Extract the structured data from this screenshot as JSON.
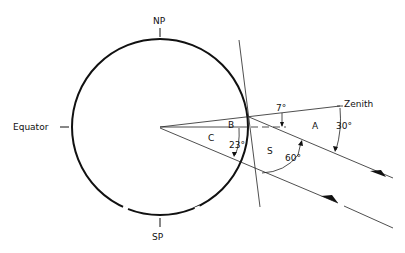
{
  "diagram": {
    "type": "earth-solar-geometry",
    "labels": {
      "north_pole": "NP",
      "south_pole": "SP",
      "equator": "Equator",
      "zenith": "Zenith",
      "region_a": "A",
      "region_b": "B",
      "region_c": "C",
      "region_s": "S"
    },
    "angles": {
      "zenith_to_horizontal": "7°",
      "zenith_to_ray": "30°",
      "ray_to_tangent": "60°",
      "latitude_ray": "23°"
    },
    "colors": {
      "stroke": "#111111",
      "background": "#ffffff"
    }
  }
}
